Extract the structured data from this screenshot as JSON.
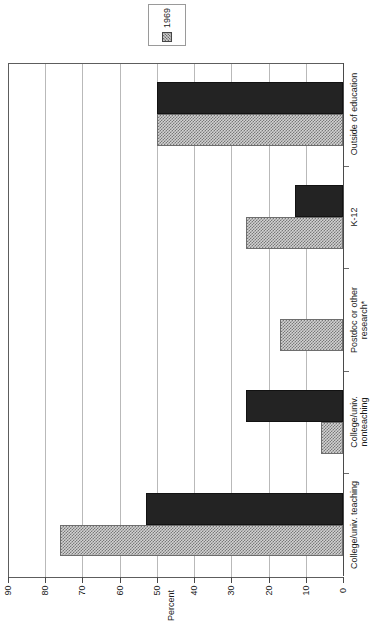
{
  "legend": {
    "entries": [
      {
        "label": "1969",
        "swatch": "hatched",
        "color": "#cfcfcf"
      }
    ]
  },
  "axis": {
    "value_axis_title": "Percent",
    "value_ticks": [
      "90",
      "80",
      "70",
      "60",
      "50",
      "40",
      "30",
      "20",
      "10",
      "0"
    ],
    "value_min": 0,
    "value_max": 90,
    "value_step": 10
  },
  "footnote_marker": "*",
  "chart_data": {
    "type": "bar",
    "orientation": "horizontal-rotated",
    "title": "",
    "xlabel": "",
    "ylabel": "Percent",
    "ylim": [
      0,
      90
    ],
    "grid": true,
    "legend_position": "top",
    "categories": [
      "College/univ. teaching",
      "College/univ.\nnonteaching",
      "Postdoc or other\nresearch*",
      "K-12",
      "Outside of education"
    ],
    "series": [
      {
        "name": "1969",
        "style": "hatched",
        "color": "#cfcfcf",
        "values": [
          76,
          6,
          17,
          26,
          50
        ]
      },
      {
        "name": "",
        "style": "solid",
        "color": "#232323",
        "values": [
          53,
          26,
          0,
          13,
          50
        ]
      }
    ]
  },
  "colors": {
    "hatch_fill": "#d2d2d2",
    "hatch_line": "#787878",
    "solid_fill": "#232323",
    "grid": "#b9b9b9",
    "axis": "#4a4a4a",
    "text": "#1a1a1a",
    "background": "#ffffff"
  }
}
